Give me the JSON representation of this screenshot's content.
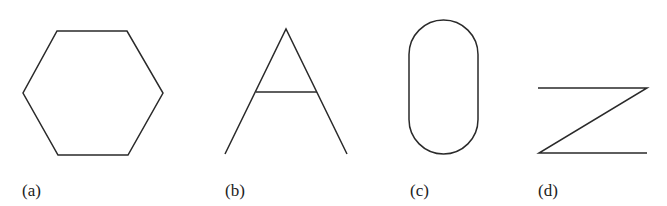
{
  "figure": {
    "panels": [
      {
        "id": "a",
        "label": "(a)",
        "shape": "hexagon"
      },
      {
        "id": "b",
        "label": "(b)",
        "shape": "letter-A-like (triangle with crossbar, open base)"
      },
      {
        "id": "c",
        "label": "(c)",
        "shape": "stadium / rounded rectangle"
      },
      {
        "id": "d",
        "label": "(d)",
        "shape": "Z-like zigzag"
      }
    ],
    "colors": {
      "stroke": "#2a2a2a",
      "background": "#ffffff",
      "text": "#222222"
    }
  }
}
